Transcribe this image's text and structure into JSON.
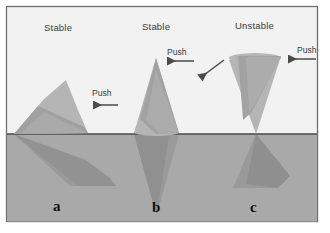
{
  "figure": {
    "colors": {
      "sky": "#f2f2f2",
      "ground": "#a9a9a9",
      "wedge_light": "#b5b5b5",
      "wedge_band": "#9a9a9a",
      "subsurface": "#949494",
      "subsurface_dark": "#8a8a8a",
      "ground_line": "#4a4a4a",
      "border": "#6e6e6e",
      "arrow": "#4a4a4a",
      "text": "#3b3b3b",
      "panel_letter": "#111111"
    },
    "border": {
      "x": 6,
      "y": 6,
      "width": 312,
      "height": 216
    },
    "ground_line_y": 134
  },
  "labels": {
    "stability": [
      {
        "key": "a",
        "text": "Stable"
      },
      {
        "key": "b",
        "text": "Stable"
      },
      {
        "key": "c",
        "text": "Unstable"
      }
    ],
    "push": [
      {
        "key": "a",
        "text": "Push"
      },
      {
        "key": "b",
        "text": "Push"
      },
      {
        "key": "c",
        "text": "Push"
      }
    ],
    "panels": [
      {
        "key": "a",
        "text": "a"
      },
      {
        "key": "b",
        "text": "b"
      },
      {
        "key": "c",
        "text": "c"
      }
    ]
  },
  "arrows": [
    {
      "name": "push-arrow-a",
      "x1": 118,
      "y1": 105,
      "x2": 92,
      "y2": 105,
      "direction": "left"
    },
    {
      "name": "push-arrow-b",
      "x1": 194,
      "y1": 61,
      "x2": 166,
      "y2": 61,
      "direction": "left"
    },
    {
      "name": "push-arrow-c",
      "x1": 315,
      "y1": 59,
      "x2": 287,
      "y2": 59,
      "direction": "left"
    },
    {
      "name": "tilt-arrow-c",
      "x1": 224,
      "y1": 61,
      "x2": 199,
      "y2": 79,
      "direction": "down-left"
    }
  ],
  "wedges": [
    {
      "key": "a",
      "name": "wedge-a",
      "description": "leaning wedge with apex up-right, resting on ground, stable",
      "outline": "14,134 64,80 88,134",
      "band": "14,134 40,104 80,128 88,134",
      "subsurface": "14,134 108,177 116,186 70,186 14,134",
      "subsurface_dark": "14,134 86,160 108,177 116,186 76,186"
    },
    {
      "key": "b",
      "name": "wedge-b",
      "description": "upright cone, apex up, wide base on ground, stable",
      "outline": "156,58 134,134 179,134",
      "band": "156,58 137,122 152,134 179,134",
      "subsurface": "134,134 157,214 179,134",
      "subsurface_dark": "134,134 151,196 157,214 168,134"
    },
    {
      "key": "c",
      "name": "wedge-c",
      "description": "inverted cone, wide at top narrow point at ground, unstable",
      "outline": "229,59 281,56 256,134",
      "band": "236,57 281,56 253,112 244,120",
      "subsurface": "256,134 235,186 276,186 288,178 256,134",
      "subsurface_dark": "256,134 245,182 276,186 288,178"
    }
  ]
}
